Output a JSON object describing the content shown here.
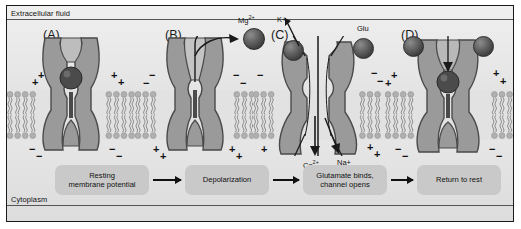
{
  "figure": {
    "extracellular_label": "Extracellular fluid",
    "cytoplasm_label": "Cytoplasm"
  },
  "panels": [
    {
      "letter": "(A)",
      "state": "resting-blocked",
      "outer_charge": "+",
      "inner_charge": "−",
      "mg_in_pore": true
    },
    {
      "letter": "(B)",
      "state": "depolarized-mg-exits",
      "outer_charge": "−",
      "inner_charge": "+",
      "mg_in_pore": false
    },
    {
      "letter": "(C)",
      "state": "glutamate-bound-open",
      "outer_charge": "−",
      "inner_charge": "+",
      "mg_in_pore": false
    },
    {
      "letter": "(D)",
      "state": "return-to-rest",
      "outer_charge": "+",
      "inner_charge": "−",
      "mg_in_pore": true
    }
  ],
  "ion_labels": {
    "mg": "Mg",
    "mg_sup": "2+",
    "k": "K+",
    "glu": "Glu",
    "ca": "Ca",
    "ca_sup": "2+",
    "na": "Na+"
  },
  "flowchart": {
    "steps": [
      "Resting\nmembrane potential",
      "Depolarization",
      "Glutamate binds,\nchannel opens",
      "Return to rest"
    ]
  },
  "colors": {
    "frame_border": "#1a1a1a",
    "background": "#e9e9e9",
    "receptor_fill": "#9a9a9a",
    "receptor_stroke": "#4a4a4a",
    "pore_fill": "#c4c4c4",
    "lipid_head": "#b0b0b0",
    "ion_sphere": "#4a4a4a",
    "flow_box": "#c9c9c9",
    "text": "#111111"
  }
}
